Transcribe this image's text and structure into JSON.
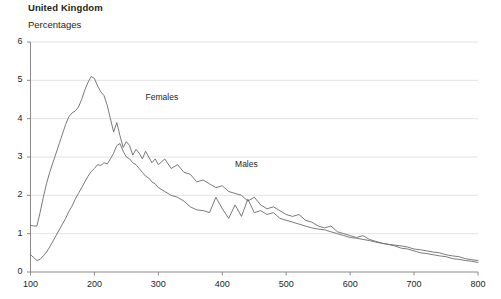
{
  "header": {
    "title": "United Kingdom",
    "subtitle": "Percentages"
  },
  "chart_data": {
    "type": "line",
    "title": "United Kingdom",
    "subtitle": "Percentages",
    "xlabel": "",
    "ylabel": "",
    "xlim": [
      100,
      800
    ],
    "ylim": [
      0,
      6
    ],
    "grid": true,
    "grid_axis": "y",
    "legend_position": "inline-annotations",
    "xticks": [
      100,
      200,
      300,
      400,
      500,
      600,
      700,
      800
    ],
    "yticks": [
      0,
      1,
      2,
      3,
      4,
      5,
      6
    ],
    "xtick_labels": [
      "100",
      "200",
      "300",
      "400",
      "500",
      "600",
      "700",
      "800"
    ],
    "ytick_labels": [
      "0",
      "1",
      "2",
      "3",
      "4",
      "5",
      "6"
    ],
    "annotations": [
      {
        "text": "Females",
        "x": 280,
        "y": 4.55
      },
      {
        "text": "Males",
        "x": 420,
        "y": 2.8
      }
    ],
    "series": [
      {
        "name": "Females",
        "color": "#6b6b6b",
        "x": [
          100,
          105,
          110,
          115,
          120,
          125,
          130,
          135,
          140,
          145,
          150,
          155,
          160,
          165,
          170,
          175,
          180,
          185,
          190,
          195,
          200,
          205,
          210,
          215,
          220,
          225,
          230,
          235,
          240,
          245,
          250,
          255,
          260,
          265,
          270,
          275,
          280,
          285,
          290,
          295,
          300,
          310,
          320,
          330,
          340,
          350,
          360,
          370,
          380,
          390,
          400,
          410,
          420,
          430,
          440,
          450,
          460,
          470,
          480,
          490,
          500,
          510,
          520,
          530,
          540,
          550,
          560,
          570,
          580,
          590,
          600,
          610,
          620,
          630,
          640,
          650,
          660,
          670,
          680,
          690,
          700,
          710,
          720,
          730,
          740,
          750,
          760,
          770,
          780,
          790,
          800
        ],
        "values": [
          1.22,
          1.2,
          1.2,
          1.55,
          1.95,
          2.3,
          2.6,
          2.85,
          3.1,
          3.35,
          3.6,
          3.85,
          4.05,
          4.15,
          4.2,
          4.3,
          4.5,
          4.75,
          4.95,
          5.1,
          5.05,
          4.85,
          4.7,
          4.6,
          4.35,
          4.0,
          3.65,
          3.9,
          3.55,
          3.25,
          3.4,
          3.3,
          3.05,
          3.2,
          3.1,
          2.95,
          3.15,
          3.0,
          2.85,
          2.95,
          2.8,
          2.95,
          2.7,
          2.8,
          2.6,
          2.55,
          2.35,
          2.4,
          2.3,
          2.2,
          2.25,
          2.1,
          2.05,
          2.0,
          1.85,
          1.95,
          1.75,
          1.65,
          1.7,
          1.6,
          1.5,
          1.45,
          1.5,
          1.35,
          1.3,
          1.2,
          1.15,
          1.2,
          1.05,
          1.0,
          0.95,
          0.9,
          0.95,
          0.85,
          0.8,
          0.75,
          0.72,
          0.68,
          0.62,
          0.6,
          0.55,
          0.5,
          0.48,
          0.45,
          0.42,
          0.4,
          0.35,
          0.33,
          0.3,
          0.28,
          0.25
        ]
      },
      {
        "name": "Males",
        "color": "#6b6b6b",
        "x": [
          100,
          105,
          110,
          115,
          120,
          125,
          130,
          135,
          140,
          145,
          150,
          155,
          160,
          165,
          170,
          175,
          180,
          185,
          190,
          195,
          200,
          205,
          210,
          215,
          220,
          225,
          230,
          235,
          240,
          245,
          250,
          255,
          260,
          265,
          270,
          275,
          280,
          285,
          290,
          295,
          300,
          310,
          320,
          330,
          340,
          350,
          360,
          370,
          380,
          390,
          400,
          410,
          420,
          430,
          440,
          450,
          460,
          470,
          480,
          490,
          500,
          510,
          520,
          530,
          540,
          550,
          560,
          570,
          580,
          590,
          600,
          610,
          620,
          630,
          640,
          650,
          660,
          670,
          680,
          690,
          700,
          710,
          720,
          730,
          740,
          750,
          760,
          770,
          780,
          790,
          800
        ],
        "values": [
          0.45,
          0.38,
          0.3,
          0.33,
          0.42,
          0.52,
          0.65,
          0.8,
          0.95,
          1.1,
          1.25,
          1.4,
          1.58,
          1.72,
          1.9,
          2.05,
          2.2,
          2.35,
          2.5,
          2.62,
          2.7,
          2.8,
          2.78,
          2.85,
          2.82,
          2.95,
          3.1,
          3.3,
          3.35,
          3.15,
          3.0,
          2.95,
          2.85,
          2.8,
          2.7,
          2.6,
          2.5,
          2.45,
          2.35,
          2.3,
          2.2,
          2.1,
          2.0,
          1.95,
          1.85,
          1.7,
          1.62,
          1.6,
          1.55,
          1.95,
          1.65,
          1.4,
          1.75,
          1.45,
          1.9,
          1.55,
          1.6,
          1.5,
          1.55,
          1.4,
          1.35,
          1.3,
          1.25,
          1.2,
          1.15,
          1.12,
          1.1,
          1.05,
          1.0,
          0.95,
          0.9,
          0.88,
          0.85,
          0.82,
          0.78,
          0.75,
          0.72,
          0.7,
          0.68,
          0.65,
          0.6,
          0.58,
          0.55,
          0.52,
          0.5,
          0.45,
          0.42,
          0.4,
          0.35,
          0.32,
          0.3
        ]
      }
    ]
  },
  "axes": {
    "y_labels": [
      "6",
      "5",
      "4",
      "3",
      "2",
      "1",
      "0"
    ],
    "x_labels": [
      "100",
      "200",
      "300",
      "400",
      "500",
      "600",
      "700",
      "800"
    ]
  },
  "colors": {
    "line": "#6b6b6b",
    "grid": "#e3e3e3",
    "axis": "#8a8a8a",
    "text": "#231f20"
  }
}
